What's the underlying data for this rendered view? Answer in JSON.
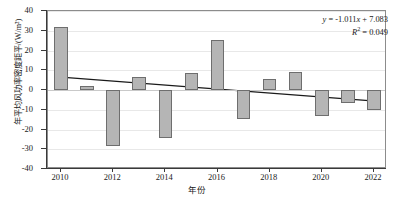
{
  "chart_data": {
    "type": "bar",
    "title": "",
    "xlabel": "年份",
    "ylabel": "年平均风功率密度距平/(W/m²)",
    "categories": [
      2010,
      2011,
      2012,
      2013,
      2014,
      2015,
      2016,
      2017,
      2018,
      2019,
      2020,
      2021,
      2022
    ],
    "values": [
      32.0,
      2.0,
      -28.5,
      6.5,
      -24.5,
      8.5,
      25.5,
      -14.5,
      5.5,
      9.0,
      -13.0,
      -6.5,
      -10.0
    ],
    "series": [
      {
        "name": "年平均风功率密度距平",
        "values": [
          32.0,
          2.0,
          -28.5,
          6.5,
          -24.5,
          8.5,
          25.5,
          -14.5,
          5.5,
          9.0,
          -13.0,
          -6.5,
          -10.0
        ]
      }
    ],
    "ylim": [
      -40,
      40
    ],
    "xlim": [
      2009.5,
      2022.5
    ],
    "ytick_labels": [
      "40",
      "30",
      "20",
      "10",
      "0",
      "-10",
      "-20",
      "-30",
      "-40"
    ],
    "ytick_values": [
      40,
      30,
      20,
      10,
      0,
      -10,
      -20,
      -30,
      -40
    ],
    "xtick_labels": [
      "2010",
      "2012",
      "2014",
      "2016",
      "2018",
      "2020",
      "2022"
    ],
    "xtick_values": [
      2010,
      2012,
      2014,
      2016,
      2018,
      2020,
      2022
    ],
    "grid": true,
    "legend": "none",
    "bar_color": "#b5b5b5",
    "bar_edge_color": "#6e6e6e",
    "trendline": {
      "type": "linear",
      "slope": -1.011,
      "intercept": 7.083,
      "r_squared": 0.049,
      "color": "#1a1a1a",
      "start_value": 6.07,
      "end_value": -6.06
    },
    "annotations": {
      "equation": "y = -1.011x + 7.083",
      "equation_lhs": "y",
      "equation_rhs": " = -1.011",
      "equation_var": "x",
      "equation_tail": " + 7.083",
      "r2_symbol": "R",
      "r2_sup": "2",
      "r2_value": " = 0.049"
    }
  }
}
